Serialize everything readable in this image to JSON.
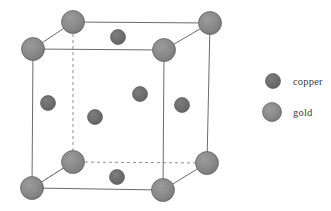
{
  "figure": {
    "background_color": "#ffffff"
  },
  "colors": {
    "copper": "#6e6e6e",
    "gold": "#8a8a8a",
    "atom_outline": "#5c5c5c",
    "edge_solid": "#6b6b6b",
    "edge_hidden": "#8f8f8f",
    "text": "#3a3a3a"
  },
  "atoms": {
    "gold_radius": 11.5,
    "copper_radius": 7.5,
    "corners": [
      {
        "name": "corner-front-top-left",
        "element": "gold",
        "x": 33,
        "y": 49
      },
      {
        "name": "corner-front-top-right",
        "element": "gold",
        "x": 164,
        "y": 50
      },
      {
        "name": "corner-front-bottom-left",
        "element": "gold",
        "x": 32,
        "y": 188
      },
      {
        "name": "corner-front-bottom-right",
        "element": "gold",
        "x": 163,
        "y": 190
      },
      {
        "name": "corner-back-top-left",
        "element": "gold",
        "x": 73,
        "y": 22
      },
      {
        "name": "corner-back-top-right",
        "element": "gold",
        "x": 210,
        "y": 23
      },
      {
        "name": "corner-back-bottom-left",
        "element": "gold",
        "x": 73,
        "y": 162
      },
      {
        "name": "corner-back-bottom-right",
        "element": "gold",
        "x": 207,
        "y": 163
      }
    ],
    "face_centers": [
      {
        "name": "face-center-top",
        "element": "copper",
        "x": 118,
        "y": 37
      },
      {
        "name": "face-center-bottom",
        "element": "copper",
        "x": 117,
        "y": 177
      },
      {
        "name": "face-center-left",
        "element": "copper",
        "x": 48,
        "y": 103
      },
      {
        "name": "face-center-right",
        "element": "copper",
        "x": 182,
        "y": 105
      },
      {
        "name": "face-center-front",
        "element": "copper",
        "x": 95,
        "y": 117
      },
      {
        "name": "face-center-back",
        "element": "copper",
        "x": 140,
        "y": 94
      }
    ]
  },
  "edges": {
    "solid": [
      {
        "name": "edge-front-top",
        "x1": 33,
        "y1": 49,
        "x2": 164,
        "y2": 50
      },
      {
        "name": "edge-front-right",
        "x1": 164,
        "y1": 50,
        "x2": 163,
        "y2": 190
      },
      {
        "name": "edge-front-bottom",
        "x1": 163,
        "y1": 190,
        "x2": 32,
        "y2": 188
      },
      {
        "name": "edge-front-left",
        "x1": 32,
        "y1": 188,
        "x2": 33,
        "y2": 49
      },
      {
        "name": "edge-back-top",
        "x1": 73,
        "y1": 22,
        "x2": 210,
        "y2": 23
      },
      {
        "name": "edge-back-right",
        "x1": 210,
        "y1": 23,
        "x2": 207,
        "y2": 163
      },
      {
        "name": "edge-diagonal-top-left",
        "x1": 33,
        "y1": 49,
        "x2": 73,
        "y2": 22
      },
      {
        "name": "edge-diagonal-top-right",
        "x1": 164,
        "y1": 50,
        "x2": 210,
        "y2": 23
      },
      {
        "name": "edge-diagonal-bottom-left",
        "x1": 32,
        "y1": 188,
        "x2": 73,
        "y2": 162
      },
      {
        "name": "edge-diagonal-bottom-right",
        "x1": 163,
        "y1": 190,
        "x2": 207,
        "y2": 163
      }
    ],
    "hidden": [
      {
        "name": "edge-back-left-vertical",
        "x1": 73,
        "y1": 22,
        "x2": 73,
        "y2": 162
      },
      {
        "name": "edge-back-bottom",
        "x1": 73,
        "y1": 162,
        "x2": 207,
        "y2": 163
      },
      {
        "name": "edge-diagonal-back-bottom-left",
        "x1": 73,
        "y1": 162,
        "x2": 32,
        "y2": 188
      }
    ],
    "dash_pattern": "3 3",
    "stroke_width": 1
  },
  "legend": {
    "items": [
      {
        "key": "copper",
        "label": "copper",
        "marker_x": 273,
        "marker_y": 81,
        "marker_r": 7.5,
        "color": "#6e6e6e"
      },
      {
        "key": "gold",
        "label": "gold",
        "marker_x": 272,
        "marker_y": 112,
        "marker_r": 9.5,
        "color": "#8a8a8a"
      }
    ]
  }
}
